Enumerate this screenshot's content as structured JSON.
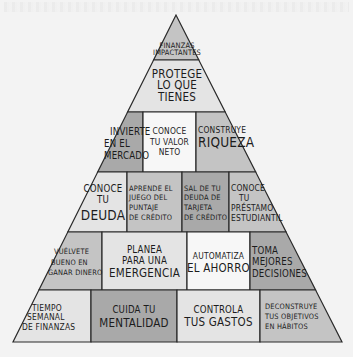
{
  "diagram": {
    "type": "pyramid",
    "colors": {
      "light": "#e4e4e4",
      "white": "#f7f7f7",
      "mid": "#c4c4c4",
      "dark": "#a9a9a9",
      "outline": "#2a2a2a",
      "background": "#f3f3f3"
    },
    "rows": [
      {
        "level": 1,
        "blocks": [
          {
            "lines": [
              "Finanzas",
              "impactantes"
            ],
            "shade": "mid"
          }
        ]
      },
      {
        "level": 2,
        "blocks": [
          {
            "lines": [
              "Protege",
              "lo que",
              "tienes"
            ],
            "shade": "light"
          }
        ]
      },
      {
        "level": 3,
        "blocks": [
          {
            "lines": [
              "Invierte",
              "en el",
              "mercado"
            ],
            "shade": "dark"
          },
          {
            "lines": [
              "Conoce",
              "tu valor",
              "neto"
            ],
            "shade": "white"
          },
          {
            "lines": [
              "Construye",
              "riqueza"
            ],
            "shade": "mid"
          }
        ]
      },
      {
        "level": 4,
        "blocks": [
          {
            "lines": [
              "Conoce",
              "tu",
              "deuda"
            ],
            "shade": "light"
          },
          {
            "lines": [
              "Aprende el",
              "juego del",
              "puntaje",
              "de crédito"
            ],
            "shade": "mid"
          },
          {
            "lines": [
              "Sal de tu",
              "deuda de",
              "tarjeta",
              "de crédito"
            ],
            "shade": "dark"
          },
          {
            "lines": [
              "Conoce",
              "tu",
              "préstamo",
              "estudiantil"
            ],
            "shade": "mid"
          }
        ]
      },
      {
        "level": 5,
        "blocks": [
          {
            "lines": [
              "Vuélvete",
              "bueno en",
              "ganar dinero"
            ],
            "shade": "mid"
          },
          {
            "lines": [
              "Planea",
              "para una",
              "emergencia"
            ],
            "shade": "light"
          },
          {
            "lines": [
              "Automatiza",
              "el ahorro"
            ],
            "shade": "white"
          },
          {
            "lines": [
              "Toma",
              "mejores",
              "decisiones"
            ],
            "shade": "dark"
          }
        ]
      },
      {
        "level": 6,
        "blocks": [
          {
            "lines": [
              "Tiempo",
              "semanal",
              "de finanzas"
            ],
            "shade": "light"
          },
          {
            "lines": [
              "Cuida tu",
              "mentalidad"
            ],
            "shade": "dark"
          },
          {
            "lines": [
              "Controla",
              "tus gastos"
            ],
            "shade": "light"
          },
          {
            "lines": [
              "Deconstruye",
              "tus objetivos",
              "en hábitos"
            ],
            "shade": "mid"
          }
        ]
      }
    ]
  }
}
